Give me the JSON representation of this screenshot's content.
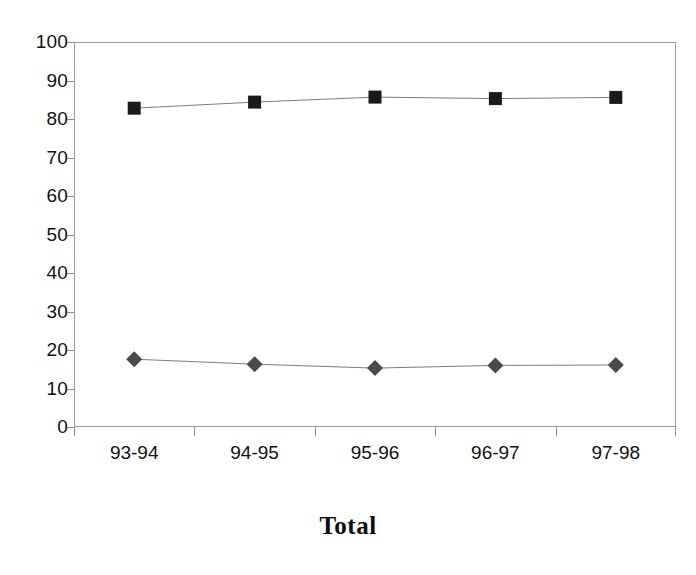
{
  "chart_data": {
    "type": "line",
    "title": "Total",
    "xlabel": "",
    "ylabel": "",
    "categories": [
      "93-94",
      "94-95",
      "95-96",
      "96-97",
      "97-98"
    ],
    "series": [
      {
        "name": "upper-series",
        "marker": "square",
        "color": "#1a1a1a",
        "values": [
          82.8,
          84.4,
          85.7,
          85.3,
          85.6
        ]
      },
      {
        "name": "lower-series",
        "marker": "diamond",
        "color": "#4a4a4a",
        "values": [
          17.6,
          16.3,
          15.3,
          16.0,
          16.1
        ]
      }
    ],
    "ylim": [
      0,
      100
    ],
    "ytick_values": [
      0,
      10,
      20,
      30,
      40,
      50,
      60,
      70,
      80,
      90,
      100
    ],
    "ytick_labels": [
      "0",
      "10",
      "20",
      "30",
      "40",
      "50",
      "60",
      "70",
      "80",
      "90",
      "100"
    ],
    "grid": false,
    "legend": false,
    "legend_position": "none",
    "line_color": "#7d7d7d",
    "axis_color": "#9a9a9a",
    "background": "#ffffff"
  }
}
